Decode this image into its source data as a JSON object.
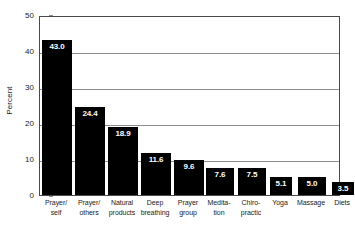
{
  "chart_data": {
    "type": "bar",
    "title": "",
    "subtitle": "",
    "xlabel": "",
    "ylabel": "Percent",
    "ylim": [
      0,
      50
    ],
    "yticks": [
      0,
      10,
      20,
      30,
      40,
      50
    ],
    "ytick_labels": [
      "0",
      "10",
      "20",
      "30",
      "40",
      "50"
    ],
    "grid": true,
    "legend": "none",
    "bar_color": "#000000",
    "value_label_color": "#ffffff",
    "categories": [
      "Prayer/ self",
      "Prayer/ others",
      "Natural products",
      "Deep breathing",
      "Prayer group",
      "Medita- tion",
      "Chiro- practic",
      "Yoga",
      "Massage",
      "Diets"
    ],
    "category_lines": [
      [
        "Prayer/",
        "self"
      ],
      [
        "Prayer/",
        "others"
      ],
      [
        "Natural",
        "products"
      ],
      [
        "Deep",
        "breathing"
      ],
      [
        "Prayer",
        "group"
      ],
      [
        "Medita-",
        "tion"
      ],
      [
        "Chiro-",
        "practic"
      ],
      [
        "Yoga",
        ""
      ],
      [
        "Massage",
        ""
      ],
      [
        "Diets",
        ""
      ]
    ],
    "values": [
      43.0,
      24.4,
      18.9,
      11.6,
      9.6,
      7.6,
      7.5,
      5.1,
      5.0,
      3.5
    ],
    "value_labels": [
      "43.0",
      "24.4",
      "18.9",
      "11.6",
      "9.6",
      "7.6",
      "7.5",
      "5.1",
      "5.0",
      "3.5"
    ]
  }
}
